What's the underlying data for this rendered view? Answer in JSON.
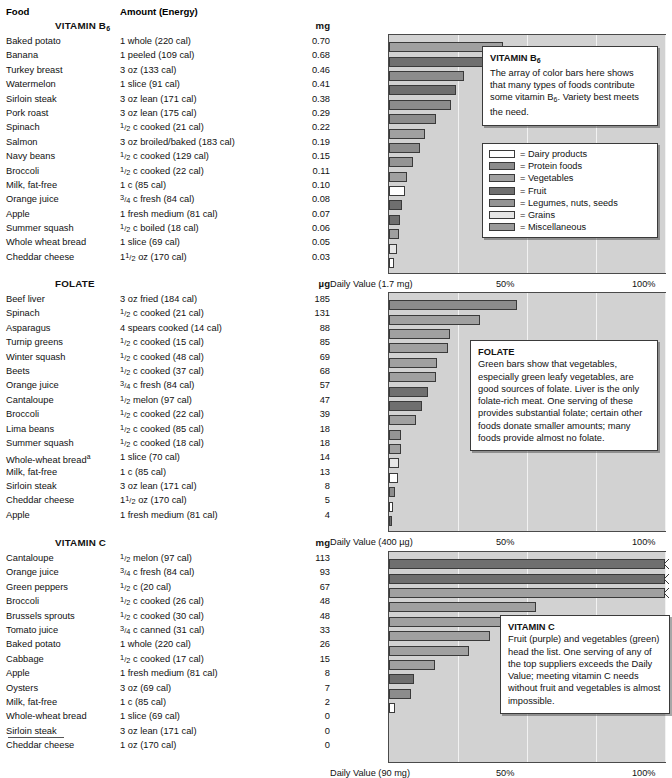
{
  "header": {
    "food_label": "Food",
    "amount_label": "Amount (Energy)"
  },
  "legend": {
    "items": [
      {
        "label": "= Dairy products",
        "group": "dairy"
      },
      {
        "label": "= Protein foods",
        "group": "protein"
      },
      {
        "label": "= Vegetables",
        "group": "veg"
      },
      {
        "label": "= Fruit",
        "group": "fruit"
      },
      {
        "label": "= Legumes, nuts, seeds",
        "group": "legume"
      },
      {
        "label": "= Grains",
        "group": "grain"
      },
      {
        "label": "= Miscellaneous",
        "group": "misc"
      }
    ]
  },
  "sections": [
    {
      "id": "b6",
      "title": "VITAMIN B6",
      "unit": "mg",
      "axis": {
        "daily_value": "Daily Value (1.7 mg)",
        "mid": "50%",
        "max": "100%"
      },
      "callout": {
        "title": "VITAMIN B6",
        "text": "The array of color bars here shows that many types of foods contribute some vitamin B6. Variety best meets the need."
      },
      "rows": [
        {
          "food": "Baked potato",
          "amount": "1 whole (220 cal)",
          "value": "0.70",
          "pct": 41.2,
          "group": "veg"
        },
        {
          "food": "Banana",
          "amount": "1 peeled (109 cal)",
          "value": "0.68",
          "pct": 40.0,
          "group": "fruit"
        },
        {
          "food": "Turkey breast",
          "amount": "3 oz (133 cal)",
          "value": "0.46",
          "pct": 27.1,
          "group": "protein"
        },
        {
          "food": "Watermelon",
          "amount": "1 slice (91 cal)",
          "value": "0.41",
          "pct": 24.1,
          "group": "fruit"
        },
        {
          "food": "Sirloin steak",
          "amount": "3 oz lean (171 cal)",
          "value": "0.38",
          "pct": 22.4,
          "group": "protein"
        },
        {
          "food": "Pork roast",
          "amount": "3 oz lean (175 cal)",
          "value": "0.29",
          "pct": 17.1,
          "group": "protein"
        },
        {
          "food": "Spinach",
          "amount": "1/2 c cooked (21 cal)",
          "value": "0.22",
          "pct": 12.9,
          "group": "veg"
        },
        {
          "food": "Salmon",
          "amount": "3 oz broiled/baked (183 cal)",
          "value": "0.19",
          "pct": 11.2,
          "group": "protein"
        },
        {
          "food": "Navy beans",
          "amount": "1/2 c cooked (129 cal)",
          "value": "0.15",
          "pct": 8.8,
          "group": "legume"
        },
        {
          "food": "Broccoli",
          "amount": "1/2 c cooked (22 cal)",
          "value": "0.11",
          "pct": 6.5,
          "group": "veg"
        },
        {
          "food": "Milk, fat-free",
          "amount": "1 c (85 cal)",
          "value": "0.10",
          "pct": 5.9,
          "group": "dairy"
        },
        {
          "food": "Orange juice",
          "amount": "3/4 c fresh (84 cal)",
          "value": "0.08",
          "pct": 4.7,
          "group": "fruit"
        },
        {
          "food": "Apple",
          "amount": "1 fresh medium (81 cal)",
          "value": "0.07",
          "pct": 4.1,
          "group": "fruit"
        },
        {
          "food": "Summer squash",
          "amount": "1/2 c boiled (18 cal)",
          "value": "0.06",
          "pct": 3.5,
          "group": "veg"
        },
        {
          "food": "Whole wheat bread",
          "amount": "1 slice (69 cal)",
          "value": "0.05",
          "pct": 2.9,
          "group": "grain"
        },
        {
          "food": "Cheddar cheese",
          "amount": "1 1/2 oz (170 cal)",
          "value": "0.03",
          "pct": 1.8,
          "group": "dairy"
        }
      ]
    },
    {
      "id": "folate",
      "title": "FOLATE",
      "unit": "µg",
      "axis": {
        "daily_value": "Daily Value (400 µg)",
        "mid": "50%",
        "max": "100%"
      },
      "callout": {
        "title": "FOLATE",
        "text": "Green bars show that vegetables, especially green leafy vegetables, are good sources of folate. Liver is the only folate-rich meat. One serving of these provides substantial folate; certain other foods donate smaller amounts; many foods provide almost no folate."
      },
      "rows": [
        {
          "food": "Beef liver",
          "amount": "3 oz fried (184 cal)",
          "value": "185",
          "pct": 46.3,
          "group": "protein"
        },
        {
          "food": "Spinach",
          "amount": "1/2 c cooked (21 cal)",
          "value": "131",
          "pct": 32.8,
          "group": "veg"
        },
        {
          "food": "Asparagus",
          "amount": "4 spears cooked (14 cal)",
          "value": "88",
          "pct": 22.0,
          "group": "veg"
        },
        {
          "food": "Turnip greens",
          "amount": "1/2 c cooked (15 cal)",
          "value": "85",
          "pct": 21.3,
          "group": "veg"
        },
        {
          "food": "Winter squash",
          "amount": "1/2 c cooked (48 cal)",
          "value": "69",
          "pct": 17.3,
          "group": "veg"
        },
        {
          "food": "Beets",
          "amount": "1/2 c cooked (37 cal)",
          "value": "68",
          "pct": 17.0,
          "group": "veg"
        },
        {
          "food": "Orange juice",
          "amount": "3/4 c fresh (84 cal)",
          "value": "57",
          "pct": 14.3,
          "group": "fruit"
        },
        {
          "food": "Cantaloupe",
          "amount": "1/2 melon (97 cal)",
          "value": "47",
          "pct": 11.8,
          "group": "fruit"
        },
        {
          "food": "Broccoli",
          "amount": "1/2 c cooked (22 cal)",
          "value": "39",
          "pct": 9.8,
          "group": "veg"
        },
        {
          "food": "Lima beans",
          "amount": "1/2 c cooked (85 cal)",
          "value": "18",
          "pct": 4.5,
          "group": "legume"
        },
        {
          "food": "Summer squash",
          "amount": "1/2 c cooked (18 cal)",
          "value": "18",
          "pct": 4.5,
          "group": "veg"
        },
        {
          "food": "Whole-wheat bread a",
          "amount": "1 slice (70 cal)",
          "value": "14",
          "pct": 3.5,
          "group": "grain"
        },
        {
          "food": "Milk, fat-free",
          "amount": "1 c (85 cal)",
          "value": "13",
          "pct": 3.3,
          "group": "dairy"
        },
        {
          "food": "Sirloin steak",
          "amount": "3 oz lean (171 cal)",
          "value": "8",
          "pct": 2.0,
          "group": "protein"
        },
        {
          "food": "Cheddar cheese",
          "amount": "1 1/2 oz (170 cal)",
          "value": "5",
          "pct": 1.3,
          "group": "dairy"
        },
        {
          "food": "Apple",
          "amount": "1 fresh medium (81 cal)",
          "value": "4",
          "pct": 1.0,
          "group": "fruit"
        }
      ]
    },
    {
      "id": "vitc",
      "title": "VITAMIN C",
      "unit": "mg",
      "axis": {
        "daily_value": "Daily Value (90 mg)",
        "mid": "50%",
        "max": "100%"
      },
      "callout": {
        "title": "VITAMIN C",
        "text": "Fruit (purple) and vegetables (green) head the list. One serving of any of the top suppliers exceeds the Daily Value; meeting vitamin C needs without fruit and vegetables is almost impossible."
      },
      "rows": [
        {
          "food": "Cantaloupe",
          "amount": "1/2 melon (97 cal)",
          "value": "113",
          "pct": 100,
          "over": true,
          "group": "fruit"
        },
        {
          "food": "Orange juice",
          "amount": "3/4 c fresh (84 cal)",
          "value": "93",
          "pct": 100,
          "over": true,
          "group": "fruit"
        },
        {
          "food": "Green peppers",
          "amount": "1/2 c (20 cal)",
          "value": "67",
          "pct": 100,
          "over": true,
          "group": "veg"
        },
        {
          "food": "Broccoli",
          "amount": "1/2 c cooked (26 cal)",
          "value": "48",
          "pct": 53.3,
          "group": "veg"
        },
        {
          "food": "Brussels sprouts",
          "amount": "1/2 c cooked (30 cal)",
          "value": "48",
          "pct": 53.3,
          "group": "veg"
        },
        {
          "food": "Tomato juice",
          "amount": "3/4 c canned (31 cal)",
          "value": "33",
          "pct": 36.7,
          "group": "veg"
        },
        {
          "food": "Baked potato",
          "amount": "1 whole (220 cal)",
          "value": "26",
          "pct": 28.9,
          "group": "veg"
        },
        {
          "food": "Cabbage",
          "amount": "1/2 c cooked (17 cal)",
          "value": "15",
          "pct": 16.7,
          "group": "veg"
        },
        {
          "food": "Apple",
          "amount": "1 fresh medium (81 cal)",
          "value": "8",
          "pct": 8.9,
          "group": "fruit"
        },
        {
          "food": "Oysters",
          "amount": "3 oz (69 cal)",
          "value": "7",
          "pct": 7.8,
          "group": "protein"
        },
        {
          "food": "Milk, fat-free",
          "amount": "1 c (85 cal)",
          "value": "2",
          "pct": 2.2,
          "group": "dairy"
        },
        {
          "food": "Whole-wheat bread",
          "amount": "1 slice (69 cal)",
          "value": "0",
          "pct": 0,
          "group": "grain"
        },
        {
          "food": "Sirloin steak",
          "amount": "3 oz lean (171 cal)",
          "value": "0",
          "pct": 0,
          "group": "protein"
        },
        {
          "food": "Cheddar cheese",
          "amount": "1 oz (170 cal)",
          "value": "0",
          "pct": 0,
          "group": "dairy"
        }
      ]
    }
  ],
  "chart_data": {
    "type": "bar",
    "xlabel": "Percent of Daily Value",
    "ylabel": "Food",
    "xlim": [
      0,
      100
    ],
    "xticks": [
      "Daily Value",
      "50%",
      "100%"
    ],
    "grid": true,
    "orientation": "horizontal",
    "legend_position": "right",
    "charts": [
      {
        "name": "VITAMIN B6",
        "unit": "mg",
        "daily_value": "1.7 mg",
        "categories": [
          "Baked potato",
          "Banana",
          "Turkey breast",
          "Watermelon",
          "Sirloin steak",
          "Pork roast",
          "Spinach",
          "Salmon",
          "Navy beans",
          "Broccoli",
          "Milk, fat-free",
          "Orange juice",
          "Apple",
          "Summer squash",
          "Whole wheat bread",
          "Cheddar cheese"
        ],
        "values": [
          0.7,
          0.68,
          0.46,
          0.41,
          0.38,
          0.29,
          0.22,
          0.19,
          0.15,
          0.11,
          0.1,
          0.08,
          0.07,
          0.06,
          0.05,
          0.03
        ],
        "percent_daily_value": [
          41.2,
          40.0,
          27.1,
          24.1,
          22.4,
          17.1,
          12.9,
          11.2,
          8.8,
          6.5,
          5.9,
          4.7,
          4.1,
          3.5,
          2.9,
          1.8
        ],
        "groups": [
          "veg",
          "fruit",
          "protein",
          "fruit",
          "protein",
          "protein",
          "veg",
          "protein",
          "legume",
          "veg",
          "dairy",
          "fruit",
          "fruit",
          "veg",
          "grain",
          "dairy"
        ]
      },
      {
        "name": "FOLATE",
        "unit": "µg",
        "daily_value": "400 µg",
        "categories": [
          "Beef liver",
          "Spinach",
          "Asparagus",
          "Turnip greens",
          "Winter squash",
          "Beets",
          "Orange juice",
          "Cantaloupe",
          "Broccoli",
          "Lima beans",
          "Summer squash",
          "Whole-wheat bread",
          "Milk, fat-free",
          "Sirloin steak",
          "Cheddar cheese",
          "Apple"
        ],
        "values": [
          185,
          131,
          88,
          85,
          69,
          68,
          57,
          47,
          39,
          18,
          18,
          14,
          13,
          8,
          5,
          4
        ],
        "percent_daily_value": [
          46.3,
          32.8,
          22.0,
          21.3,
          17.3,
          17.0,
          14.3,
          11.8,
          9.8,
          4.5,
          4.5,
          3.5,
          3.3,
          2.0,
          1.3,
          1.0
        ],
        "groups": [
          "protein",
          "veg",
          "veg",
          "veg",
          "veg",
          "veg",
          "fruit",
          "fruit",
          "veg",
          "legume",
          "veg",
          "grain",
          "dairy",
          "protein",
          "dairy",
          "fruit"
        ]
      },
      {
        "name": "VITAMIN C",
        "unit": "mg",
        "daily_value": "90 mg",
        "categories": [
          "Cantaloupe",
          "Orange juice",
          "Green peppers",
          "Broccoli",
          "Brussels sprouts",
          "Tomato juice",
          "Baked potato",
          "Cabbage",
          "Apple",
          "Oysters",
          "Milk, fat-free",
          "Whole-wheat bread",
          "Sirloin steak",
          "Cheddar cheese"
        ],
        "values": [
          113,
          93,
          67,
          48,
          48,
          33,
          26,
          15,
          8,
          7,
          2,
          0,
          0,
          0
        ],
        "percent_daily_value": [
          125.6,
          103.3,
          74.4,
          53.3,
          53.3,
          36.7,
          28.9,
          16.7,
          8.9,
          7.8,
          2.2,
          0,
          0,
          0
        ],
        "groups": [
          "fruit",
          "fruit",
          "veg",
          "veg",
          "veg",
          "veg",
          "veg",
          "veg",
          "fruit",
          "protein",
          "dairy",
          "grain",
          "protein",
          "dairy"
        ]
      }
    ]
  }
}
